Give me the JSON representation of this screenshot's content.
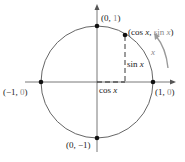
{
  "diagram": {
    "points": [
      {
        "label_a": "(0, ",
        "label_b": "1",
        "label_c": ")",
        "x": 0,
        "y": 1
      },
      {
        "label_a": "(1, ",
        "label_b": "0",
        "label_c": ")",
        "x": 1,
        "y": 0
      },
      {
        "label_a": "(−1, ",
        "label_b": "0",
        "label_c": ")",
        "x": -1,
        "y": 0
      },
      {
        "label_a": "(0, −1",
        "label_b": "",
        "label_c": ")",
        "x": 0,
        "y": -1
      }
    ],
    "moving_point": {
      "label_open": "(cos ",
      "label_x": "x",
      "label_mid": ", ",
      "label_sin": "sin ",
      "label_x2": "x",
      "label_close": ")"
    },
    "sin_label": {
      "fn": "sin ",
      "var": "x"
    },
    "cos_label": {
      "fn": "cos ",
      "var": "x"
    },
    "arc_label": "x",
    "colors": {
      "stroke": "#555555",
      "point": "#111111",
      "arrow": "#9a9a9a"
    }
  }
}
